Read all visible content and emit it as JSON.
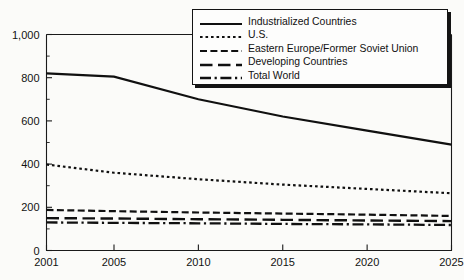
{
  "chart_data": {
    "type": "line",
    "title": "",
    "subtitle": "",
    "xlabel": "",
    "ylabel": "",
    "xlim": [
      2001,
      2025
    ],
    "ylim": [
      0,
      1000
    ],
    "ytick_values": [
      0,
      200,
      400,
      600,
      800,
      1000
    ],
    "ytick_labels": [
      "0",
      "200",
      "400",
      "600",
      "800",
      "1,000"
    ],
    "yminor_values": [
      100,
      300,
      500,
      700,
      900
    ],
    "xtick_values": [
      2001,
      2005,
      2010,
      2015,
      2020,
      2025
    ],
    "xtick_labels": [
      "2001",
      "2005",
      "2010",
      "2015",
      "2020",
      "2025"
    ],
    "grid": false,
    "legend_position": "top-right",
    "x": [
      2001,
      2005,
      2010,
      2015,
      2020,
      2025
    ],
    "series": [
      {
        "name": "Industrialized Countries",
        "style": "solid",
        "values": [
          820,
          805,
          700,
          620,
          555,
          490
        ]
      },
      {
        "name": "U.S.",
        "style": "dotted",
        "values": [
          398,
          360,
          330,
          305,
          285,
          265
        ]
      },
      {
        "name": "Eastern Europe/Former Soviet Union",
        "style": "dashed",
        "values": [
          188,
          182,
          176,
          171,
          166,
          160
        ]
      },
      {
        "name": "Developing Countries",
        "style": "longdash",
        "values": [
          150,
          148,
          145,
          142,
          139,
          136
        ]
      },
      {
        "name": "Total World",
        "style": "dashdot",
        "values": [
          130,
          128,
          126,
          123,
          121,
          118
        ]
      }
    ]
  },
  "legend": {
    "items": [
      {
        "label": "Industrialized Countries",
        "style": "solid"
      },
      {
        "label": "U.S.",
        "style": "dotted"
      },
      {
        "label": "Eastern Europe/Former Soviet Union",
        "style": "dashed"
      },
      {
        "label": "Developing Countries",
        "style": "longdash"
      },
      {
        "label": "Total World",
        "style": "dashdot"
      }
    ]
  },
  "colors": {
    "ink": "#101010",
    "background": "#fbfbf9",
    "legend_background": "#fdfdfc"
  }
}
